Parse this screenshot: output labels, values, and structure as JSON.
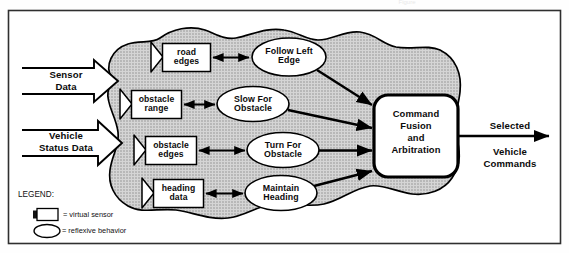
{
  "figure": {
    "title_faint": "Figure",
    "region_label": "reflexive behavior layer",
    "frame_color": "#2b2b2b",
    "blob_fill": "#c9c9c9",
    "blob_stroke": "#000000"
  },
  "inputs": [
    {
      "id": "sensor-data",
      "label": "Sensor\nData"
    },
    {
      "id": "vehicle-status-data",
      "label": "Vehicle\nStatus Data"
    }
  ],
  "virtual_sensors": [
    {
      "id": "road-edges",
      "label": "road\nedges"
    },
    {
      "id": "obstacle-range",
      "label": "obstacle\nrange"
    },
    {
      "id": "obstacle-edges",
      "label": "obstacle\nedges"
    },
    {
      "id": "heading-data",
      "label": "heading\ndata"
    }
  ],
  "behaviors": [
    {
      "id": "follow-left-edge",
      "label": "Follow Left\nEdge"
    },
    {
      "id": "slow-for-obstacle",
      "label": "Slow For\nObstacle"
    },
    {
      "id": "turn-for-obstacle",
      "label": "Turn For\nObstacle"
    },
    {
      "id": "maintain-heading",
      "label": "Maintain\nHeading"
    }
  ],
  "fusion": {
    "id": "command-fusion-and-arbitration",
    "label": "Command\nFusion\nand\nArbitration"
  },
  "output": {
    "id": "selected-vehicle-commands",
    "label_top": "Selected",
    "label_bottom": "Vehicle\nCommands"
  },
  "legend": {
    "title": "LEGEND:",
    "items": [
      {
        "symbol": "virtual-sensor-symbol",
        "text": "= virtual sensor"
      },
      {
        "symbol": "reflexive-behavior-symbol",
        "text": "= reflexive behavior"
      }
    ]
  }
}
